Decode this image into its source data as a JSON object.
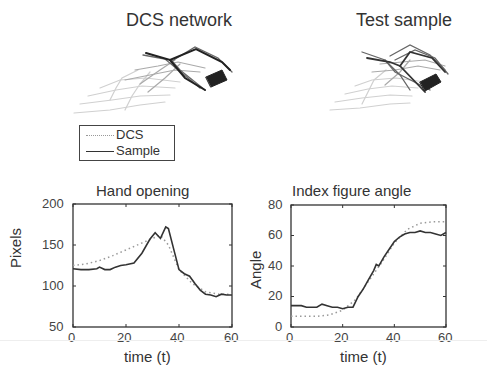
{
  "figure": {
    "top_left_title": "DCS network",
    "top_right_title": "Test sample",
    "legend": [
      {
        "label": "DCS",
        "style": "dotted",
        "color": "#999999"
      },
      {
        "label": "Sample",
        "style": "solid",
        "color": "#333333"
      }
    ]
  },
  "chart_data": [
    {
      "type": "line",
      "title": "Hand opening",
      "xlabel": "time (t)",
      "ylabel": "Pixels",
      "xlim": [
        0,
        60
      ],
      "ylim": [
        50,
        200
      ],
      "xticks": [
        "0",
        "20",
        "40",
        "60"
      ],
      "yticks": [
        "50",
        "100",
        "150",
        "200"
      ],
      "grid": false,
      "series": [
        {
          "name": "DCS",
          "style": "dotted",
          "x": [
            0,
            5,
            10,
            15,
            20,
            25,
            30,
            33,
            36,
            40,
            45,
            50,
            55,
            60
          ],
          "values": [
            125,
            127,
            131,
            137,
            144,
            151,
            158,
            162,
            150,
            120,
            103,
            93,
            90,
            90
          ]
        },
        {
          "name": "Sample",
          "style": "solid",
          "x": [
            0,
            3,
            6,
            9,
            10,
            12,
            14,
            16,
            18,
            20,
            23,
            26,
            29,
            31,
            33,
            35,
            36,
            38,
            40,
            42,
            44,
            46,
            48,
            50,
            52,
            54,
            56,
            58,
            60
          ],
          "values": [
            121,
            120,
            120,
            121,
            123,
            120,
            120,
            123,
            125,
            126,
            128,
            140,
            157,
            165,
            158,
            172,
            170,
            145,
            120,
            115,
            112,
            103,
            95,
            90,
            89,
            87,
            90,
            89,
            89
          ]
        }
      ]
    },
    {
      "type": "line",
      "title": "Index figure angle",
      "xlabel": "time (t)",
      "ylabel": "Angle",
      "xlim": [
        0,
        60
      ],
      "ylim": [
        0,
        80
      ],
      "xticks": [
        "0",
        "20",
        "40",
        "60"
      ],
      "yticks": [
        "0",
        "20",
        "40",
        "60",
        "80"
      ],
      "grid": false,
      "series": [
        {
          "name": "DCS",
          "style": "dotted",
          "x": [
            0,
            5,
            10,
            15,
            20,
            25,
            30,
            35,
            40,
            45,
            50,
            55,
            60
          ],
          "values": [
            7,
            7,
            7,
            8,
            11,
            18,
            30,
            42,
            55,
            64,
            68,
            69,
            69
          ]
        },
        {
          "name": "Sample",
          "style": "solid",
          "x": [
            0,
            2,
            4,
            6,
            8,
            10,
            12,
            14,
            16,
            18,
            20,
            22,
            24,
            26,
            28,
            30,
            32,
            33,
            34,
            36,
            38,
            40,
            42,
            44,
            46,
            48,
            50,
            52,
            54,
            56,
            58,
            60
          ],
          "values": [
            14,
            14,
            14,
            13,
            13,
            13,
            15,
            14,
            13,
            13,
            12,
            13,
            13,
            20,
            25,
            31,
            37,
            41,
            40,
            46,
            51,
            56,
            59,
            61,
            62,
            62,
            63,
            62,
            62,
            61,
            60,
            62
          ]
        }
      ]
    }
  ]
}
